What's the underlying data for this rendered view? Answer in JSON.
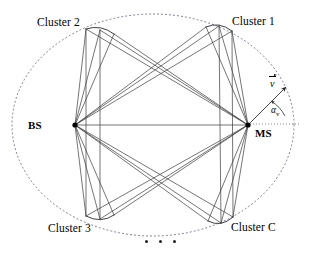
{
  "figure": {
    "type": "diagram",
    "background_color": "#ffffff",
    "line_color": "#3a3a3a",
    "boundary_color": "#6f6f8a",
    "node_color": "#000000"
  },
  "boundary": {
    "name": "scattering-ellipse",
    "style": "dotted",
    "cx": 153,
    "cy": 125,
    "rx": 141,
    "ry": 111
  },
  "terminals": [
    {
      "id": "bs",
      "label": "BS",
      "x": 75,
      "y": 125,
      "label_x": 27,
      "label_y": 119
    },
    {
      "id": "ms",
      "label": "MS",
      "x": 248,
      "y": 125,
      "label_x": 255,
      "label_y": 128
    }
  ],
  "clusters": [
    {
      "id": "cluster2",
      "label": "Cluster 2",
      "x": 95,
      "y": 30,
      "label_x": 37,
      "label_y": 18,
      "spread_from": 12,
      "spread_to": 36,
      "spread_angle": -20
    },
    {
      "id": "cluster1",
      "label": "Cluster 1",
      "x": 225,
      "y": 27,
      "label_x": 232,
      "label_y": 17,
      "spread_from": 12,
      "spread_to": 36,
      "spread_angle": 20
    },
    {
      "id": "cluster3",
      "label": "Cluster 3",
      "x": 95,
      "y": 218,
      "label_x": 48,
      "label_y": 224,
      "spread_from": 12,
      "spread_to": 36,
      "spread_angle": 20
    },
    {
      "id": "clusterC",
      "label": "Cluster C",
      "x": 225,
      "y": 222,
      "label_x": 232,
      "label_y": 223,
      "spread_from": 12,
      "spread_to": 36,
      "spread_angle": -20
    }
  ],
  "velocity": {
    "symbol": "v",
    "label_x": 272,
    "label_y": 80,
    "arrow_from_x": 250,
    "arrow_from_y": 123,
    "arrow_to_x": 287,
    "arrow_to_y": 86,
    "angle_label": "α",
    "angle_subscript": "v",
    "angle_label_x": 272,
    "angle_label_y": 108,
    "reference_line_from_x": 250,
    "reference_line_from_y": 124,
    "reference_line_to_x": 299,
    "reference_line_to_y": 124
  },
  "ellipsis": {
    "name": "more-clusters-ellipsis",
    "dot_count": 3,
    "x": 145,
    "y": 241
  },
  "link_bundle": {
    "rays_per_cluster": 3,
    "description": "Three sub-paths connect BS to each cluster and each cluster to MS"
  }
}
